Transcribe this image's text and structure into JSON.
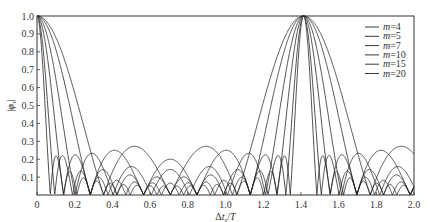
{
  "chart_data": {
    "type": "line",
    "title": "",
    "xlabel": "Δt_s/T",
    "ylabel": "|φ_τ|",
    "xlim": [
      0,
      2.0
    ],
    "ylim": [
      0,
      1.0
    ],
    "xticks": [
      "0",
      "0.2",
      "0.4",
      "0.6",
      "0.8",
      "1.0",
      "1.2",
      "1.4",
      "1.6",
      "1.8",
      "2.0"
    ],
    "xtick_values": [
      0,
      0.2,
      0.4,
      0.6,
      0.8,
      1.0,
      1.2,
      1.4,
      1.6,
      1.8,
      2.0
    ],
    "yticks": [
      "0",
      "0.1",
      "0.2",
      "0.3",
      "0.4",
      "0.5",
      "0.6",
      "0.7",
      "0.8",
      "0.9",
      "1.0"
    ],
    "ytick_values": [
      0,
      0.1,
      0.2,
      0.3,
      0.4,
      0.5,
      0.6,
      0.7,
      0.8,
      0.9,
      1.0
    ],
    "grid": false,
    "legend_position": "top-right",
    "function": "|sin(π·m·x/√2) / (m·sin(π·x/√2))|",
    "period": 1.4142,
    "series": [
      {
        "name": "m=4",
        "m": 4,
        "legend_prefix": "m",
        "legend_suffix": "=4"
      },
      {
        "name": "m=5",
        "m": 5,
        "legend_prefix": "m",
        "legend_suffix": "=5"
      },
      {
        "name": "m=7",
        "m": 7,
        "legend_prefix": "m",
        "legend_suffix": "=7"
      },
      {
        "name": "m=10",
        "m": 10,
        "legend_prefix": "m",
        "legend_suffix": "=10"
      },
      {
        "name": "m=15",
        "m": 15,
        "legend_prefix": "m",
        "legend_suffix": "=15"
      },
      {
        "name": "m=20",
        "m": 20,
        "legend_prefix": "m",
        "legend_suffix": "=20"
      }
    ],
    "line_color": "#222222"
  }
}
